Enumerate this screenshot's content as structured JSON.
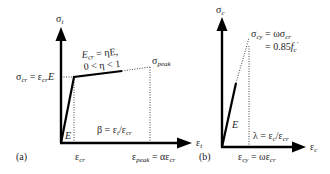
{
  "panel_a": {
    "label": "(a)",
    "y_axis": {
      "sym": "σ",
      "sub": "t"
    },
    "x_axis": {
      "sym": "ε",
      "sub": "t"
    },
    "crack_label": {
      "left": "σ",
      "sub": "cr",
      "eq": " = ε",
      "sub2": "cr",
      "tail": "E"
    },
    "softening_label_line1": {
      "pre": "E",
      "sub": "cr",
      "post": " = ηE,"
    },
    "softening_label_line2": "0 < η < 1",
    "peak_label": {
      "sym": "σ",
      "sub": "peak"
    },
    "slope_label": "E",
    "beta_label": {
      "pre": "β = ε",
      "sub": "t",
      "mid": "/ε",
      "sub2": "cr"
    },
    "x_tick_cr": {
      "sym": "ε",
      "sub": "cr"
    },
    "x_tick_peak": {
      "sym": "ε",
      "sub": "peak",
      "eq": " = αε",
      "sub2": "cr"
    }
  },
  "panel_b": {
    "label": "(b)",
    "y_axis": {
      "sym": "σ",
      "sub": "c"
    },
    "x_axis": {
      "sym": "ε",
      "sub": "c"
    },
    "yield_label_line1": {
      "sym": "σ",
      "sub": "cy",
      "eq": " = ωσ",
      "sub2": "cr"
    },
    "yield_label_line2": {
      "pre": "= 0.85",
      "f": "f",
      "sub": "c",
      "sup": "′"
    },
    "slope_label": "E",
    "lambda_label": {
      "pre": "λ = ε",
      "sub": "c",
      "mid": "/ε",
      "sub2": "cr"
    },
    "x_tick_cy": {
      "sym": "ε",
      "sub": "cy",
      "eq": " = ωε",
      "sub2": "cr"
    }
  }
}
